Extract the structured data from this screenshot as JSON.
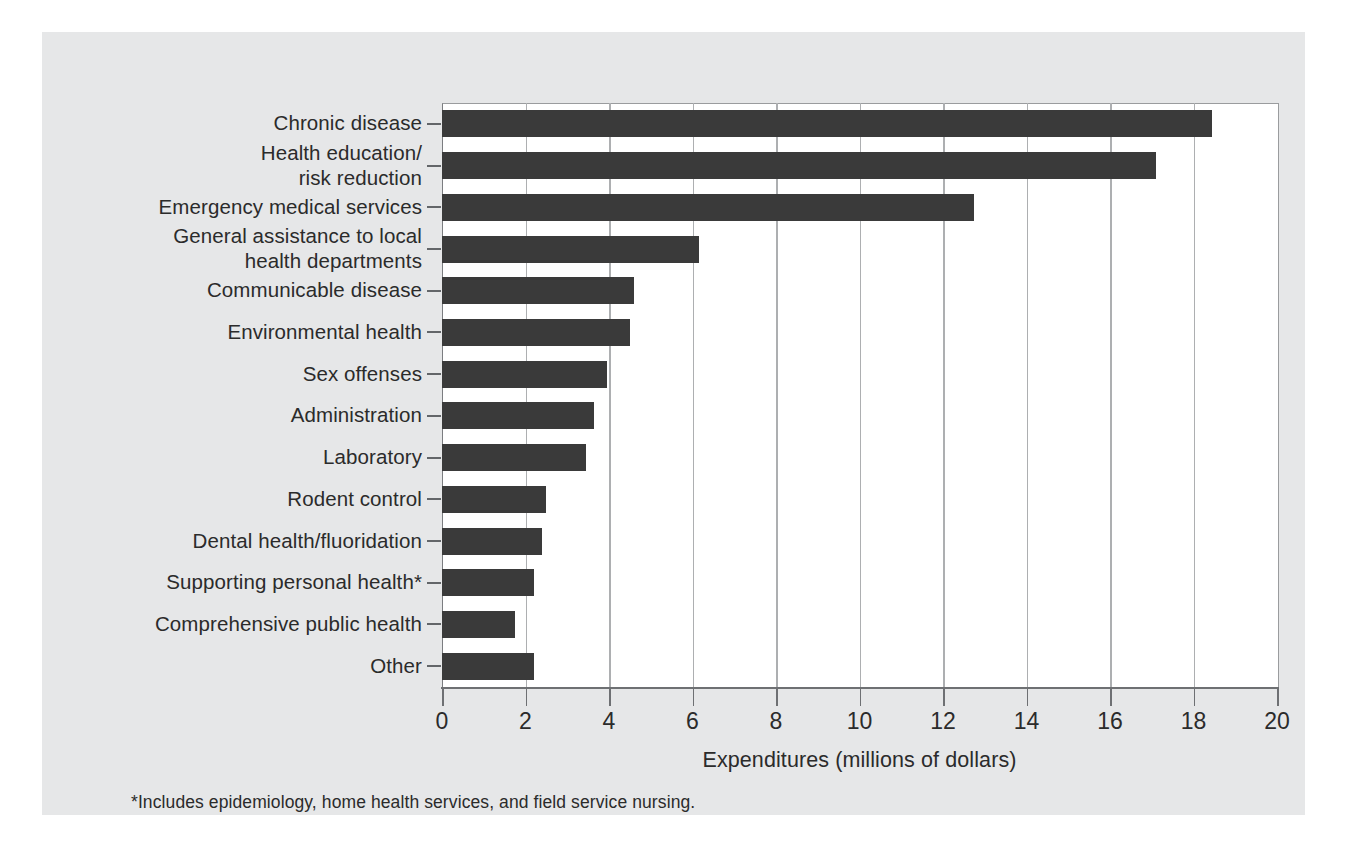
{
  "chart_data": {
    "type": "bar",
    "orientation": "horizontal",
    "title": "",
    "xlabel": "Expenditures (millions of dollars)",
    "ylabel": "",
    "xlim": [
      0,
      20
    ],
    "xticks": [
      0,
      2,
      4,
      6,
      8,
      10,
      12,
      14,
      16,
      18,
      20
    ],
    "grid": true,
    "legend": null,
    "bar_color": "#3a3a3a",
    "panel_color": "#e6e7e8",
    "plot_bg_color": "#ffffff",
    "categories": [
      "Chronic disease",
      "Health education/\nrisk reduction",
      "Emergency medical services",
      "General assistance to local\nhealth departments",
      "Communicable disease",
      "Environmental health",
      "Sex offenses",
      "Administration",
      "Laboratory",
      "Rodent control",
      "Dental health/fluoridation",
      "Supporting personal health*",
      "Comprehensive public health",
      "Other"
    ],
    "values": [
      18.45,
      17.1,
      12.75,
      6.15,
      4.6,
      4.5,
      3.95,
      3.65,
      3.45,
      2.5,
      2.4,
      2.2,
      1.75,
      2.2
    ],
    "annotations": [
      "*Includes epidemiology, home health services, and field service nursing."
    ]
  },
  "footnote": "*Includes epidemiology, home health services, and field service nursing.",
  "axis": {
    "x_title": "Expenditures (millions of dollars)"
  }
}
